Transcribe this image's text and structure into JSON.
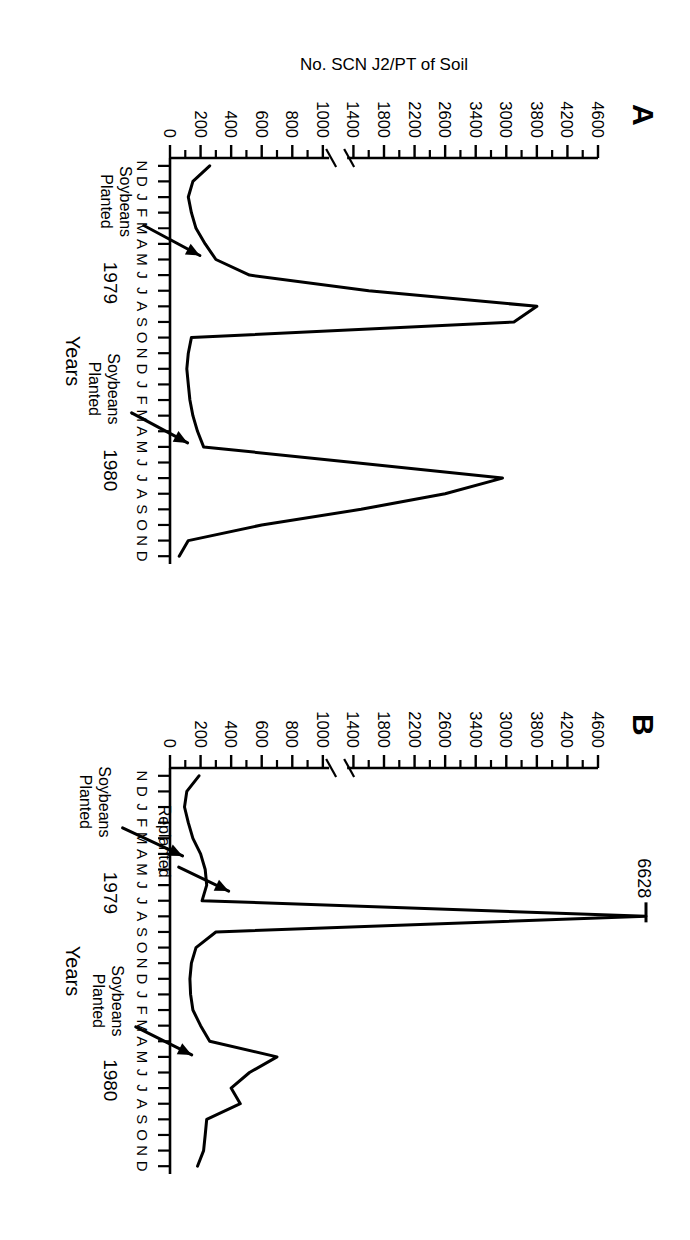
{
  "figure": {
    "y_axis_title": "No. SCN J2/PT of Soil",
    "x_axis_title": "Years",
    "panels": [
      {
        "letter": "A",
        "annotations": [
          {
            "text_line1": "Soybeans",
            "text_line2": "Planted"
          }
        ]
      },
      {
        "letter": "B",
        "peak_label": "6628",
        "annotations": [
          {
            "text_line1": "Replanted",
            "text_line2": ""
          },
          {
            "text_line1": "Soybeans",
            "text_line2": "Planted"
          },
          {
            "text_line1": "Soybeans",
            "text_line2": "Planted"
          }
        ]
      }
    ]
  },
  "chart_data": {
    "type": "line",
    "title": "",
    "xlabel": "Years",
    "ylabel": "No. SCN J2/PT of Soil",
    "x_tick_labels": [
      "N",
      "D",
      "J",
      "F",
      "M",
      "A",
      "M",
      "J",
      "J",
      "A",
      "S",
      "O",
      "N",
      "D",
      "J",
      "F",
      "M",
      "A",
      "M",
      "J",
      "J",
      "A",
      "S",
      "O",
      "N",
      "D"
    ],
    "year_labels": [
      "1979",
      "1980"
    ],
    "y_tick_labels": [
      "0",
      "200",
      "400",
      "600",
      "800",
      "1000",
      "1400",
      "1800",
      "2200",
      "2600",
      "3400",
      "3000",
      "3800",
      "4200",
      "4600"
    ],
    "y_tick_values": [
      0,
      200,
      400,
      600,
      800,
      1000,
      1400,
      1800,
      2200,
      2600,
      3000,
      3400,
      3800,
      4200,
      4600
    ],
    "y_axis_break_between": [
      1000,
      1400
    ],
    "ylim": [
      0,
      4600
    ],
    "grid": false,
    "legend": "none",
    "note": "Y tick labels 3000 and 3400 appear transposed in the printed original; displayed order preserved.",
    "panels": [
      {
        "name": "A",
        "letter": "A",
        "series": [
          {
            "name": "SCN J2 per pint of soil",
            "x": [
              "N",
              "D",
              "J",
              "F",
              "M",
              "A",
              "M",
              "J",
              "J",
              "A",
              "S",
              "O",
              "N",
              "D",
              "J",
              "F",
              "M",
              "A",
              "M",
              "J",
              "J",
              "A",
              "S",
              "O",
              "N",
              "D"
            ],
            "values": [
              260,
              150,
              120,
              140,
              170,
              230,
              300,
              520,
              1600,
              3800,
              3500,
              140,
              120,
              110,
              120,
              130,
              150,
              180,
              220,
              1400,
              3350,
              2600,
              1500,
              600,
              120,
              60
            ]
          }
        ],
        "annotations": [
          {
            "label": "Soybeans Planted",
            "x": "M",
            "year": "1979",
            "points_to_x": "M",
            "points_to_value": 300
          },
          {
            "label": "Soybeans Planted",
            "x": "M",
            "year": "1980",
            "points_to_x": "M",
            "points_to_value": 220
          }
        ]
      },
      {
        "name": "B",
        "letter": "B",
        "series": [
          {
            "name": "SCN J2 per pint of soil",
            "x": [
              "N",
              "D",
              "J",
              "F",
              "M",
              "A",
              "M",
              "J",
              "J",
              "A",
              "S",
              "O",
              "N",
              "D",
              "J",
              "F",
              "M",
              "A",
              "M",
              "J",
              "J",
              "A",
              "S",
              "O",
              "N",
              "D"
            ],
            "values": [
              190,
              110,
              95,
              120,
              150,
              200,
              230,
              240,
              210,
              6628,
              300,
              170,
              140,
              130,
              135,
              150,
              200,
              260,
              700,
              520,
              400,
              460,
              240,
              230,
              220,
              180
            ]
          }
        ],
        "off_scale_peak": {
          "label": "6628",
          "value": 6628,
          "x": "A",
          "year": "1979"
        },
        "annotations": [
          {
            "label": "Replanted",
            "x": "M",
            "year": "1979",
            "points_to_x": "M",
            "points_to_value": 230
          },
          {
            "label": "Soybeans Planted",
            "x": "A",
            "year": "1979",
            "points_to_x": "A",
            "points_to_value": 200
          },
          {
            "label": "Soybeans Planted",
            "x": "M",
            "year": "1980",
            "points_to_x": "M",
            "points_to_value": 260
          }
        ]
      }
    ]
  }
}
